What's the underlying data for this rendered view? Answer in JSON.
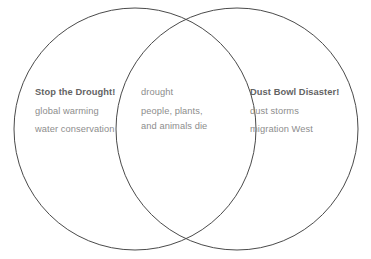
{
  "diagram": {
    "type": "venn-diagram",
    "background_color": "#ffffff",
    "stroke_color": "#4a4a4a",
    "heading_color": "#636363",
    "item_color": "#8d8d8d",
    "left_circle": {
      "center_x": 135,
      "center_y": 129,
      "radius": 121
    },
    "right_circle": {
      "center_x": 237,
      "center_y": 129,
      "radius": 121
    }
  },
  "left": {
    "heading": "Stop the Drought!",
    "items": [
      "global warming",
      "water conservation"
    ]
  },
  "center": {
    "heading": "drought",
    "items": [
      "people, plants,",
      "and animals die"
    ]
  },
  "right": {
    "heading": "Dust Bowl Disaster!",
    "items": [
      "dust storms",
      "migration West"
    ]
  }
}
